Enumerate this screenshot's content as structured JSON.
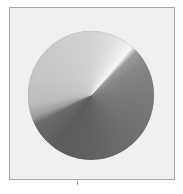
{
  "figure": {
    "description": "Conical (angular) gradient disc on a dithered light-gray canvas",
    "canvas": {
      "border_color": "#a9a9a9",
      "background_color": "#ebebeb",
      "dither_color": "#f5f5f5"
    },
    "disc": {
      "gradient_type": "conic",
      "highlight_angle_deg": 40,
      "shadow_edge_angle_deg": 250,
      "colors": {
        "top": "#d2d2d2",
        "highlight": "#f8f8f8",
        "right": "#7a7a7a",
        "bottom": "#616161",
        "left": "#c6c6c6"
      }
    },
    "tick_mark_color": "#9a9a9a"
  }
}
